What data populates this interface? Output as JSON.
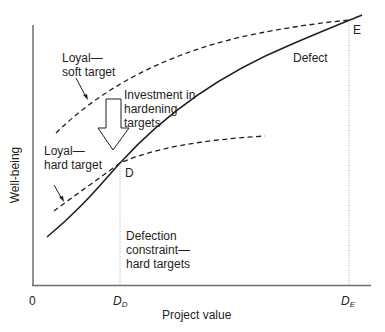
{
  "diagram": {
    "axes": {
      "x_label": "Project value",
      "y_label": "Well-being",
      "origin_label": "0",
      "x_ticks": [
        {
          "main": "D",
          "sub": "D"
        },
        {
          "main": "D",
          "sub": "E"
        }
      ]
    },
    "curves": [
      {
        "name": "Loyal—soft target",
        "style": "dashed"
      },
      {
        "name": "Loyal—hard target",
        "style": "dashed"
      },
      {
        "name": "Defect",
        "style": "solid"
      }
    ],
    "labels": {
      "soft_target_line1": "Loyal—",
      "soft_target_line2": "soft target",
      "hard_target_line1": "Loyal—",
      "hard_target_line2": "hard target",
      "investment_line1": "Investment in",
      "investment_line2": "hardening",
      "investment_line3": "targets",
      "defect": "Defect",
      "point_d": "D",
      "point_e": "E",
      "constraint_line1": "Defection",
      "constraint_line2": "constraint—",
      "constraint_line3": "hard targets"
    },
    "colors": {
      "line": "#231f20",
      "axis": "#6d6e71",
      "dotted": "#a7a9ac"
    }
  }
}
